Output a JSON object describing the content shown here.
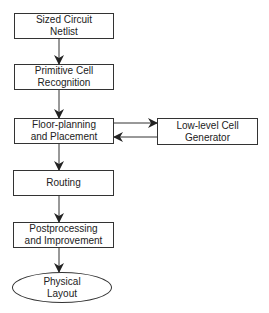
{
  "diagram": {
    "type": "flowchart",
    "nodes": [
      {
        "id": "n1",
        "label_line1": "Sized Circuit",
        "label_line2": "Netlist",
        "shape": "rect"
      },
      {
        "id": "n2",
        "label_line1": "Primitive Cell",
        "label_line2": "Recognition",
        "shape": "rect"
      },
      {
        "id": "n3",
        "label_line1": "Floor-planning",
        "label_line2": "and Placement",
        "shape": "rect"
      },
      {
        "id": "n4",
        "label_line1": "Low-level Cell",
        "label_line2": "Generator",
        "shape": "rect"
      },
      {
        "id": "n5",
        "label_line1": "Routing",
        "label_line2": "",
        "shape": "rect"
      },
      {
        "id": "n6",
        "label_line1": "Postprocessing",
        "label_line2": "and Improvement",
        "shape": "rect"
      },
      {
        "id": "n7",
        "label_line1": "Physical",
        "label_line2": "Layout",
        "shape": "ellipse"
      }
    ],
    "edges": [
      {
        "from": "n1",
        "to": "n2"
      },
      {
        "from": "n2",
        "to": "n3"
      },
      {
        "from": "n3",
        "to": "n4"
      },
      {
        "from": "n4",
        "to": "n3"
      },
      {
        "from": "n3",
        "to": "n5"
      },
      {
        "from": "n5",
        "to": "n6"
      },
      {
        "from": "n6",
        "to": "n7"
      }
    ]
  }
}
